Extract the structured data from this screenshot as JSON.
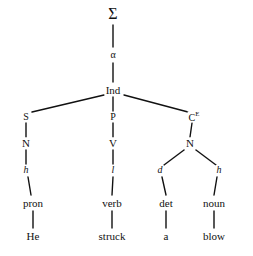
{
  "diagram": {
    "type": "syntactic-tree",
    "sentence": "He struck a blow",
    "stroke_color": "#111111",
    "background_color": "#ffffff",
    "nodes": [
      {
        "id": "sigma",
        "label": "Σ",
        "style": "greek",
        "x": 113,
        "y": 14,
        "size": 16
      },
      {
        "id": "alpha",
        "label": "α",
        "style": "greek",
        "x": 113,
        "y": 55,
        "size": 10
      },
      {
        "id": "ind",
        "label": "Ind",
        "style": "upright",
        "x": 113,
        "y": 90,
        "size": 11
      },
      {
        "id": "s-branch",
        "label": "S",
        "style": "upright",
        "x": 26,
        "y": 117,
        "size": 10
      },
      {
        "id": "p-branch",
        "label": "P",
        "style": "upright",
        "x": 113,
        "y": 117,
        "size": 10
      },
      {
        "id": "c-branch",
        "label": "C",
        "style": "upright",
        "x": 194,
        "y": 117,
        "size": 10,
        "superscript": "E"
      },
      {
        "id": "n-left",
        "label": "N",
        "style": "upright",
        "x": 26,
        "y": 143,
        "size": 11
      },
      {
        "id": "v-mid",
        "label": "V",
        "style": "upright",
        "x": 113,
        "y": 143,
        "size": 11
      },
      {
        "id": "n-right",
        "label": "N",
        "style": "upright",
        "x": 190,
        "y": 143,
        "size": 11
      },
      {
        "id": "h-left",
        "label": "h",
        "style": "italic",
        "x": 26,
        "y": 170,
        "size": 10
      },
      {
        "id": "l-mid",
        "label": "l",
        "style": "italic",
        "x": 113,
        "y": 170,
        "size": 10
      },
      {
        "id": "d-det",
        "label": "d",
        "style": "italic",
        "x": 160,
        "y": 170,
        "size": 10
      },
      {
        "id": "h-right",
        "label": "h",
        "style": "italic",
        "x": 219,
        "y": 170,
        "size": 10
      },
      {
        "id": "pron",
        "label": "pron",
        "style": "upright",
        "x": 33,
        "y": 203,
        "size": 11
      },
      {
        "id": "verb",
        "label": "verb",
        "style": "upright",
        "x": 112,
        "y": 203,
        "size": 11
      },
      {
        "id": "det",
        "label": "det",
        "style": "upright",
        "x": 166,
        "y": 203,
        "size": 11
      },
      {
        "id": "noun",
        "label": "noun",
        "style": "upright",
        "x": 214,
        "y": 203,
        "size": 11
      },
      {
        "id": "he",
        "label": "He",
        "style": "upright",
        "x": 33,
        "y": 236,
        "size": 11
      },
      {
        "id": "struck",
        "label": "struck",
        "style": "upright",
        "x": 112,
        "y": 236,
        "size": 11
      },
      {
        "id": "a",
        "label": "a",
        "style": "upright",
        "x": 166,
        "y": 236,
        "size": 11
      },
      {
        "id": "blow",
        "label": "blow",
        "style": "upright",
        "x": 214,
        "y": 236,
        "size": 11
      }
    ],
    "edges": [
      {
        "id": "sigma-alpha",
        "x1": 113,
        "y1": 25,
        "x2": 113,
        "y2": 47
      },
      {
        "id": "alpha-ind",
        "x1": 113,
        "y1": 63,
        "x2": 113,
        "y2": 82
      },
      {
        "id": "ind-s",
        "x1": 104,
        "y1": 95,
        "x2": 32,
        "y2": 112
      },
      {
        "id": "ind-p",
        "x1": 113,
        "y1": 97,
        "x2": 113,
        "y2": 111
      },
      {
        "id": "ind-c",
        "x1": 124,
        "y1": 95,
        "x2": 188,
        "y2": 112
      },
      {
        "id": "s-n",
        "x1": 26,
        "y1": 123,
        "x2": 26,
        "y2": 137
      },
      {
        "id": "p-v",
        "x1": 113,
        "y1": 123,
        "x2": 113,
        "y2": 137
      },
      {
        "id": "c-n",
        "x1": 192,
        "y1": 123,
        "x2": 190,
        "y2": 137
      },
      {
        "id": "n-h-left",
        "x1": 26,
        "y1": 150,
        "x2": 26,
        "y2": 164
      },
      {
        "id": "v-l-mid",
        "x1": 113,
        "y1": 150,
        "x2": 113,
        "y2": 164
      },
      {
        "id": "nright-d",
        "x1": 184,
        "y1": 150,
        "x2": 164,
        "y2": 165
      },
      {
        "id": "nright-h",
        "x1": 196,
        "y1": 150,
        "x2": 216,
        "y2": 165
      },
      {
        "id": "h-pron",
        "x1": 28,
        "y1": 177,
        "x2": 31,
        "y2": 195
      },
      {
        "id": "l-verb",
        "x1": 113,
        "y1": 177,
        "x2": 112,
        "y2": 195
      },
      {
        "id": "d-det",
        "x1": 162,
        "y1": 177,
        "x2": 166,
        "y2": 195
      },
      {
        "id": "h-noun",
        "x1": 217,
        "y1": 177,
        "x2": 214,
        "y2": 195
      },
      {
        "id": "pron-he",
        "x1": 33,
        "y1": 211,
        "x2": 33,
        "y2": 228
      },
      {
        "id": "verb-struck",
        "x1": 112,
        "y1": 211,
        "x2": 112,
        "y2": 228
      },
      {
        "id": "det-a",
        "x1": 166,
        "y1": 211,
        "x2": 166,
        "y2": 228
      },
      {
        "id": "noun-blow",
        "x1": 214,
        "y1": 211,
        "x2": 214,
        "y2": 228
      }
    ]
  }
}
